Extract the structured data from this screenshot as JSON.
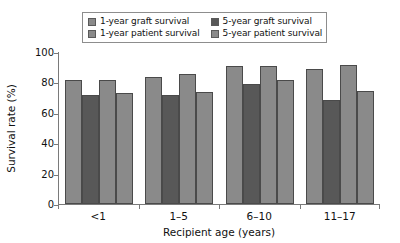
{
  "chart_data": {
    "type": "bar",
    "title": "",
    "xlabel": "Recipient age (years)",
    "ylabel": "Survival rate (%)",
    "ylim": [
      0,
      100
    ],
    "yticks": [
      0,
      20,
      40,
      60,
      80,
      100
    ],
    "grid": false,
    "legend_position": "top-center",
    "categories": [
      "<1",
      "1–5",
      "6–10",
      "11–17"
    ],
    "series": [
      {
        "name": "1-year graft survival",
        "color": "#8a8a8a",
        "values": [
          81.5,
          83.5,
          91.0,
          89.0
        ]
      },
      {
        "name": "5-year graft survival",
        "color": "#585858",
        "values": [
          71.5,
          71.5,
          79.0,
          68.5
        ]
      },
      {
        "name": "1-year patient survival",
        "color": "#8a8a8a",
        "values": [
          81.5,
          85.5,
          91.0,
          91.5
        ]
      },
      {
        "name": "5-year patient survival",
        "color": "#8a8a8a",
        "values": [
          73.0,
          74.0,
          81.5,
          74.5
        ]
      }
    ]
  },
  "legend": {
    "items": [
      {
        "label": "1-year graft survival",
        "color": "#8a8a8a"
      },
      {
        "label": "5-year graft survival",
        "color": "#585858"
      },
      {
        "label": "1-year patient survival",
        "color": "#8a8a8a"
      },
      {
        "label": "5-year patient survival",
        "color": "#8a8a8a"
      }
    ]
  },
  "axes": {
    "y_title": "Survival rate (%)",
    "x_title": "Recipient age (years)",
    "y_tick_labels": [
      "100",
      "80",
      "60",
      "40",
      "20",
      "0"
    ],
    "x_tick_labels": [
      "<1",
      "1–5",
      "6–10",
      "11–17"
    ]
  },
  "colors": {
    "bar_light": "#8a8a8a",
    "bar_dark": "#585858",
    "bar_stroke": "#4a4a4a",
    "axis": "#7a7a7a",
    "text": "#111111",
    "legend_border": "#8d8d8d",
    "background": "#ffffff"
  }
}
